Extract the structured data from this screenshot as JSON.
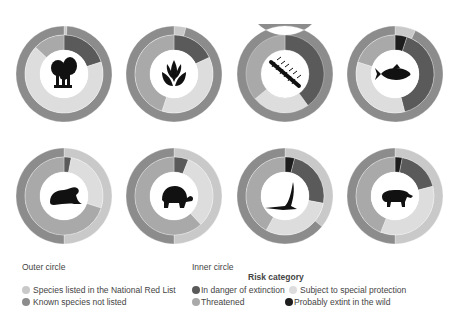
{
  "colors": {
    "listed": "#c9c9c9",
    "not_listed": "#8c8c8c",
    "in_danger": "#5a5a5a",
    "threatened": "#a9a9a9",
    "special_protection": "#dddddd",
    "extinct_wild": "#1e1e1e"
  },
  "chart_data": {
    "type": "pie",
    "subtype": "nested-donut",
    "title": "",
    "charts": [
      {
        "group": "fungi",
        "icon": "mushroom",
        "outer": [
          {
            "name": "Species listed in the National Red List",
            "value": 0.01
          },
          {
            "name": "Known species not listed",
            "value": 0.99
          }
        ],
        "inner": [
          {
            "name": "In danger of extinction",
            "value": 0.2
          },
          {
            "name": "Subject to special protection",
            "value": 0.67
          },
          {
            "name": "Threatened",
            "value": 0.13
          }
        ]
      },
      {
        "group": "plants",
        "icon": "plant",
        "outer": [
          {
            "name": "Species listed in the National Red List",
            "value": 0.04
          },
          {
            "name": "Known species not listed",
            "value": 0.96
          }
        ],
        "inner": [
          {
            "name": "In danger of extinction",
            "value": 0.18
          },
          {
            "name": "Subject to special protection",
            "value": 0.37
          },
          {
            "name": "Threatened",
            "value": 0.45
          }
        ]
      },
      {
        "group": "invertebrates",
        "icon": "centipede",
        "outer": [
          {
            "name": "Species listed in the National Red List",
            "value": 0.0
          },
          {
            "name": "Known species not listed",
            "value": 1.0
          }
        ],
        "inner": [
          {
            "name": "In danger of extinction",
            "value": 0.4
          },
          {
            "name": "Subject to special protection",
            "value": 0.24
          },
          {
            "name": "Threatened",
            "value": 0.36
          }
        ]
      },
      {
        "group": "fish",
        "icon": "fish",
        "outer": [
          {
            "name": "Species listed in the National Red List",
            "value": 0.07
          },
          {
            "name": "Known species not listed",
            "value": 0.93
          }
        ],
        "inner": [
          {
            "name": "Probably extint in the wild",
            "value": 0.05
          },
          {
            "name": "In danger of extinction",
            "value": 0.41
          },
          {
            "name": "Subject to special protection",
            "value": 0.34
          },
          {
            "name": "Threatened",
            "value": 0.2
          }
        ]
      },
      {
        "group": "amphibians",
        "icon": "frog",
        "outer": [
          {
            "name": "Species listed in the National Red List",
            "value": 0.5
          },
          {
            "name": "Known species not listed",
            "value": 0.5
          }
        ],
        "inner": [
          {
            "name": "In danger of extinction",
            "value": 0.03
          },
          {
            "name": "Subject to special protection",
            "value": 0.27
          },
          {
            "name": "Threatened",
            "value": 0.7
          }
        ]
      },
      {
        "group": "reptiles",
        "icon": "turtle",
        "outer": [
          {
            "name": "Species listed in the National Red List",
            "value": 0.5
          },
          {
            "name": "Known species not listed",
            "value": 0.5
          }
        ],
        "inner": [
          {
            "name": "In danger of extinction",
            "value": 0.06
          },
          {
            "name": "Subject to special protection",
            "value": 0.32
          },
          {
            "name": "Threatened",
            "value": 0.62
          }
        ]
      },
      {
        "group": "birds",
        "icon": "bird",
        "outer": [
          {
            "name": "Species listed in the National Red List",
            "value": 0.36
          },
          {
            "name": "Known species not listed",
            "value": 0.64
          }
        ],
        "inner": [
          {
            "name": "Probably extint in the wild",
            "value": 0.04
          },
          {
            "name": "In danger of extinction",
            "value": 0.24
          },
          {
            "name": "Subject to special protection",
            "value": 0.3
          },
          {
            "name": "Threatened",
            "value": 0.42
          }
        ]
      },
      {
        "group": "mammals",
        "icon": "tapir",
        "outer": [
          {
            "name": "Species listed in the National Red List",
            "value": 0.5
          },
          {
            "name": "Known species not listed",
            "value": 0.5
          }
        ],
        "inner": [
          {
            "name": "Probably extint in the wild",
            "value": 0.03
          },
          {
            "name": "In danger of extinction",
            "value": 0.18
          },
          {
            "name": "Subject to special protection",
            "value": 0.35
          },
          {
            "name": "Threatened",
            "value": 0.44
          }
        ]
      }
    ],
    "legend": {
      "outer_title": "Outer circle",
      "outer_items": [
        "Species listed in the National Red List",
        "Known species not listed"
      ],
      "inner_title": "Inner circle",
      "inner_subtitle": "Risk category",
      "inner_items": [
        "In danger of extinction",
        "Threatened",
        "Subject to special protection",
        "Probably extint in the wild"
      ]
    }
  },
  "legend": {
    "outer_title": "Outer circle",
    "outer_listed": "Species listed in the National Red List",
    "outer_not_listed": "Known species not listed",
    "inner_title": "Inner circle",
    "risk_title": "Risk category",
    "in_danger": "In danger of extinction",
    "threatened": "Threatened",
    "special_protection": "Subject to special protection",
    "extinct_wild": "Probably extint in the wild"
  }
}
